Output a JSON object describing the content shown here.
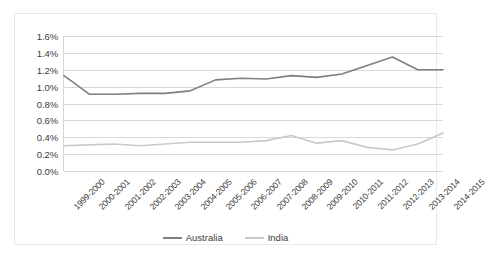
{
  "chart_data": {
    "type": "line",
    "title": "",
    "xlabel": "",
    "ylabel": "",
    "ylim": [
      0,
      1.6
    ],
    "y_tick_values": [
      0.0,
      0.2,
      0.4,
      0.6,
      0.8,
      1.0,
      1.2,
      1.4,
      1.6
    ],
    "y_tick_labels": [
      "0.0%",
      "0.2%",
      "0.4%",
      "0.6%",
      "0.8%",
      "1.0%",
      "1.2%",
      "1.4%",
      "1.6%"
    ],
    "grid": true,
    "legend_position": "bottom",
    "categories": [
      "1999-2000",
      "2000-2001",
      "2001-2002",
      "2002-2003",
      "2003-2004",
      "2004-2005",
      "2005-2006",
      "2006-2007",
      "2007-2008",
      "2008-2009",
      "2009-2010",
      "2010-2011",
      "2011-2012",
      "2012-2013",
      "2013-2014",
      "2014-2015"
    ],
    "series": [
      {
        "name": "Australia",
        "color": "#7f7f7f",
        "values": [
          1.13,
          0.91,
          0.91,
          0.92,
          0.92,
          0.95,
          1.08,
          1.1,
          1.09,
          1.13,
          1.11,
          1.15,
          1.25,
          1.35,
          1.2,
          1.2
        ]
      },
      {
        "name": "India",
        "color": "#c9c9c9",
        "values": [
          0.3,
          0.31,
          0.32,
          0.3,
          0.32,
          0.34,
          0.34,
          0.34,
          0.36,
          0.42,
          0.33,
          0.36,
          0.28,
          0.25,
          0.32,
          0.45
        ]
      }
    ]
  },
  "legend": {
    "items": [
      {
        "label": "Australia",
        "color": "#7f7f7f"
      },
      {
        "label": "India",
        "color": "#c9c9c9"
      }
    ]
  }
}
